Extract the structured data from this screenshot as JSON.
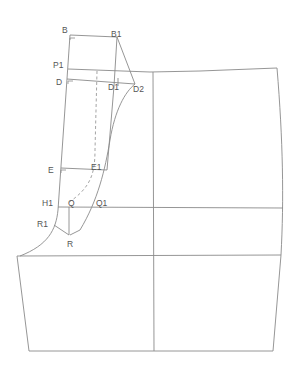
{
  "diagram": {
    "type": "pattern-draft",
    "colors": {
      "line": "#8a8a8a",
      "label": "#555555",
      "background": "#ffffff"
    },
    "labels": [
      {
        "id": "B",
        "text": "B",
        "x": 62,
        "y": 26
      },
      {
        "id": "B1",
        "text": "B1",
        "x": 111,
        "y": 30
      },
      {
        "id": "P1",
        "text": "P1",
        "x": 53,
        "y": 61
      },
      {
        "id": "D",
        "text": "D",
        "x": 56,
        "y": 78
      },
      {
        "id": "D1",
        "text": "D1",
        "x": 108,
        "y": 83
      },
      {
        "id": "D2",
        "text": "D2",
        "x": 133,
        "y": 85
      },
      {
        "id": "E",
        "text": "E",
        "x": 48,
        "y": 166
      },
      {
        "id": "E1",
        "text": "E1",
        "x": 91,
        "y": 164
      },
      {
        "id": "H1",
        "text": "H1",
        "x": 42,
        "y": 199
      },
      {
        "id": "Q",
        "text": "Q",
        "x": 68,
        "y": 199
      },
      {
        "id": "Q1",
        "text": "Q1",
        "x": 96,
        "y": 199
      },
      {
        "id": "R1",
        "text": "R1",
        "x": 37,
        "y": 220
      },
      {
        "id": "R",
        "text": "R",
        "x": 67,
        "y": 240
      }
    ]
  }
}
